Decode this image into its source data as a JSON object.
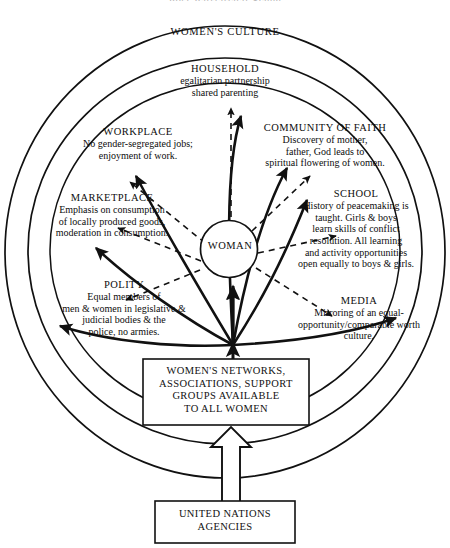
{
  "title": "Post-Patriarchal Scene",
  "rings": {
    "outer_label": "WOMEN'S CULTURE"
  },
  "center": {
    "label": "WOMAN"
  },
  "sectors": [
    {
      "id": "household",
      "heading": "HOUSEHOLD",
      "lines": [
        "egalitarian partnership",
        "shared parenting"
      ]
    },
    {
      "id": "workplace",
      "heading": "WORKPLACE",
      "lines": [
        "No gender-segregated jobs;",
        "enjoyment of work."
      ]
    },
    {
      "id": "community-of-faith",
      "heading": "COMMUNITY OF FAITH",
      "lines": [
        "Discovery of mother,",
        "father, God leads to",
        "spiritual flowering of women."
      ]
    },
    {
      "id": "marketplace",
      "heading": "MARKETPLACE",
      "lines": [
        "Emphasis on consumption",
        "of locally produced goods,",
        "moderation in consumption."
      ]
    },
    {
      "id": "school",
      "heading": "SCHOOL",
      "lines": [
        "History of peacemaking is",
        "taught. Girls & boys",
        "learn skills of conflict",
        "resolution. All learning",
        "and activity opportunities",
        "open equally to boys & girls."
      ]
    },
    {
      "id": "polity",
      "heading": "POLITY",
      "lines": [
        "Equal members of",
        "men & women in legislative &",
        "judicial bodies & the",
        "police, no armies."
      ]
    },
    {
      "id": "media",
      "heading": "MEDIA",
      "lines": [
        "Mirroring of an equal-",
        "opportunity/comparable worth",
        "culture."
      ]
    }
  ],
  "boxes": [
    {
      "id": "networks",
      "lines": [
        "WOMEN'S NETWORKS,",
        "ASSOCIATIONS, SUPPORT",
        "GROUPS AVAILABLE",
        "TO ALL WOMEN"
      ]
    },
    {
      "id": "united-nations",
      "lines": [
        "UNITED NATIONS",
        "AGENCIES"
      ]
    }
  ],
  "colors": {
    "ink": "#111111",
    "background": "#ffffff"
  }
}
